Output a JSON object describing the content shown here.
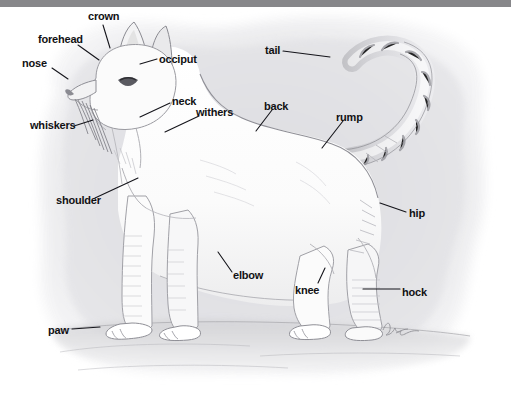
{
  "figure": {
    "medium": "pencil-and-wash illustration",
    "artist_signature": "Kuhn",
    "background_color": "#ffffff",
    "top_bar_color": "#87878a",
    "label_color": "#111114",
    "leader_line_color": "#14141a",
    "body_fill": "#fdfdfd",
    "wash_fill": "#e6e6e8"
  },
  "labels": [
    {
      "id": "crown",
      "text": "crown",
      "x": 88,
      "y": 11,
      "anchor": "start"
    },
    {
      "id": "forehead",
      "text": "forehead",
      "x": 38,
      "y": 34,
      "anchor": "start"
    },
    {
      "id": "nose",
      "text": "nose",
      "x": 22,
      "y": 58,
      "anchor": "start"
    },
    {
      "id": "occiput",
      "text": "occiput",
      "x": 159,
      "y": 54,
      "anchor": "start"
    },
    {
      "id": "tail",
      "text": "tail",
      "x": 265,
      "y": 45,
      "anchor": "start"
    },
    {
      "id": "whiskers",
      "text": "whiskers",
      "x": 30,
      "y": 120,
      "anchor": "start"
    },
    {
      "id": "neck",
      "text": "neck",
      "x": 172,
      "y": 96,
      "anchor": "start"
    },
    {
      "id": "withers",
      "text": "withers",
      "x": 196,
      "y": 107,
      "anchor": "start"
    },
    {
      "id": "back",
      "text": "back",
      "x": 264,
      "y": 101,
      "anchor": "start"
    },
    {
      "id": "rump",
      "text": "rump",
      "x": 336,
      "y": 112,
      "anchor": "start"
    },
    {
      "id": "shoulder",
      "text": "shoulder",
      "x": 56,
      "y": 195,
      "anchor": "start"
    },
    {
      "id": "hip",
      "text": "hip",
      "x": 409,
      "y": 208,
      "anchor": "start"
    },
    {
      "id": "elbow",
      "text": "elbow",
      "x": 233,
      "y": 270,
      "anchor": "start"
    },
    {
      "id": "knee",
      "text": "knee",
      "x": 295,
      "y": 285,
      "anchor": "start"
    },
    {
      "id": "hock",
      "text": "hock",
      "x": 402,
      "y": 287,
      "anchor": "start"
    },
    {
      "id": "paw",
      "text": "paw",
      "x": 48,
      "y": 325,
      "anchor": "start"
    }
  ],
  "leader_lines": [
    {
      "id": "crown-line",
      "points": "103,25 110,48"
    },
    {
      "id": "forehead-line",
      "points": "78,45 99,60"
    },
    {
      "id": "nose-line",
      "points": "52,68 68,79"
    },
    {
      "id": "occiput-line",
      "points": "157,59 140,64"
    },
    {
      "id": "tail-line",
      "points": "283,51 330,57"
    },
    {
      "id": "whiskers-line",
      "points": "74,126 93,120"
    },
    {
      "id": "neck-line",
      "points": "170,103 140,117"
    },
    {
      "id": "withers-line",
      "points": "199,116 165,132"
    },
    {
      "id": "back-line",
      "points": "272,110 256,131"
    },
    {
      "id": "rump-line",
      "points": "343,121 322,148"
    },
    {
      "id": "shoulder-line",
      "points": "95,198 138,178"
    },
    {
      "id": "hip-line",
      "points": "406,212 380,203"
    },
    {
      "id": "elbow-line",
      "points": "232,272 218,252"
    },
    {
      "id": "knee-line",
      "points": "318,283 325,268"
    },
    {
      "id": "hock-line",
      "points": "400,289 363,289"
    },
    {
      "id": "paw-line",
      "points": "72,329 100,327"
    }
  ]
}
